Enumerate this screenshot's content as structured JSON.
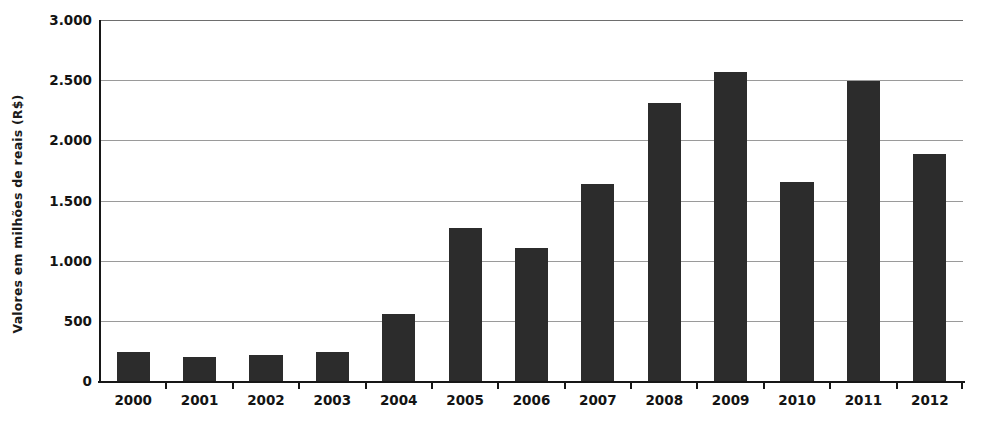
{
  "chart_data": {
    "type": "bar",
    "title": "",
    "xlabel": "",
    "ylabel": "Valores em milhões de reais (R$)",
    "categories": [
      "2000",
      "2001",
      "2002",
      "2003",
      "2004",
      "2005",
      "2006",
      "2007",
      "2008",
      "2009",
      "2010",
      "2011",
      "2012"
    ],
    "values": [
      245,
      200,
      215,
      245,
      560,
      1270,
      1105,
      1635,
      2310,
      2570,
      1650,
      2495,
      1885
    ],
    "ylim": [
      0,
      3000
    ],
    "ytick_values": [
      0,
      500,
      1000,
      1500,
      2000,
      2500,
      3000
    ],
    "ytick_labels": [
      "0",
      "500",
      "1.000",
      "1.500",
      "2.000",
      "2.500",
      "3.000"
    ],
    "grid": true,
    "legend": false,
    "bar_color": "#2c2c2c",
    "grid_color": "#9a9a9a",
    "axis_color": "#171717",
    "background_color": "#ffffff"
  }
}
